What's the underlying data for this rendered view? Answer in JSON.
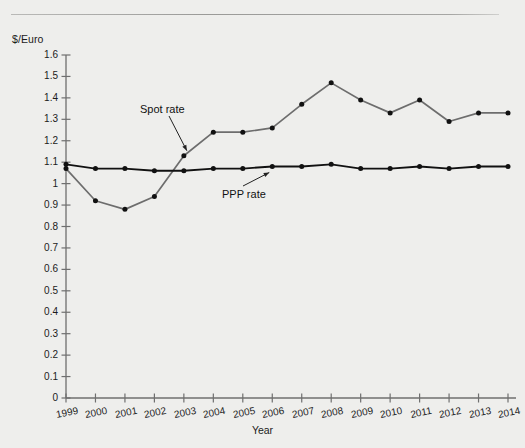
{
  "figure": {
    "background_color": "#eeeeec",
    "has_top_rule": true,
    "source_note": ""
  },
  "chart_data": {
    "type": "line",
    "title": "",
    "xlabel": "Year",
    "ylabel": "$/Euro",
    "y_unit_label": "$/Euro",
    "categories": [
      "1999",
      "2000",
      "2001",
      "2002",
      "2003",
      "2004",
      "2005",
      "2006",
      "2007",
      "2008",
      "2009",
      "2010",
      "2011",
      "2012",
      "2013",
      "2014"
    ],
    "x": [
      1999,
      2000,
      2001,
      2002,
      2003,
      2004,
      2005,
      2006,
      2007,
      2008,
      2009,
      2010,
      2011,
      2012,
      2013,
      2014
    ],
    "ylim": [
      0,
      1.6
    ],
    "xlim": [
      1999,
      2014
    ],
    "yticks": [
      "0",
      "0.1",
      "0.2",
      "0.3",
      "0.4",
      "0.5",
      "0.6",
      "0.7",
      "0.8",
      "0.9",
      "1",
      "1.1",
      "1.2",
      "1.3",
      "1.4",
      "1.5",
      "1.6"
    ],
    "ytick_values": [
      0,
      0.1,
      0.2,
      0.3,
      0.4,
      0.5,
      0.6,
      0.7,
      0.8,
      0.9,
      1.0,
      1.1,
      1.2,
      1.3,
      1.4,
      1.5,
      1.6
    ],
    "xticks": [
      "1999",
      "2000",
      "2001",
      "2002",
      "2003",
      "2004",
      "2005",
      "2006",
      "2007",
      "2008",
      "2009",
      "2010",
      "2011",
      "2012",
      "2013",
      "2014"
    ],
    "grid": false,
    "legend_position": "inline-annotations",
    "markers": "filled-circle",
    "series": [
      {
        "name": "Spot rate",
        "label": "Spot rate",
        "color": "#6d6d6d",
        "marker_color": "#111111",
        "values": [
          1.07,
          0.92,
          0.88,
          0.94,
          1.13,
          1.24,
          1.24,
          1.26,
          1.37,
          1.47,
          1.39,
          1.33,
          1.39,
          1.29,
          1.33,
          1.33
        ]
      },
      {
        "name": "PPP rate",
        "label": "PPP rate",
        "color": "#111111",
        "marker_color": "#111111",
        "values": [
          1.09,
          1.07,
          1.07,
          1.06,
          1.06,
          1.07,
          1.07,
          1.08,
          1.08,
          1.09,
          1.07,
          1.07,
          1.08,
          1.07,
          1.08,
          1.08
        ]
      }
    ],
    "annotations": [
      {
        "text": "Spot rate",
        "target_year": 2003,
        "target_value": 1.13
      },
      {
        "text": "PPP rate",
        "target_value": 1.07,
        "target_year": 2006
      }
    ]
  }
}
